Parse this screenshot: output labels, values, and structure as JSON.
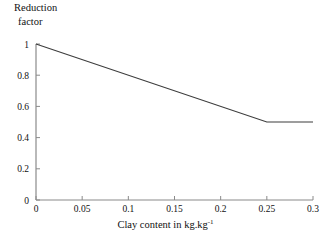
{
  "chart_data": {
    "type": "line",
    "title": "",
    "xlabel": "Clay content in kg.kg",
    "xlabel_exponent": "-1",
    "ylabel_line1": "Reduction",
    "ylabel_line2": "factor",
    "xlim": [
      0,
      0.3
    ],
    "ylim": [
      0,
      1
    ],
    "grid": false,
    "legend": "none",
    "xticks": [
      "0",
      "0.05",
      "0.1",
      "0.15",
      "0.2",
      "0.25",
      "0.3"
    ],
    "xtick_values": [
      0,
      0.05,
      0.1,
      0.15,
      0.2,
      0.25,
      0.3
    ],
    "yticks": [
      "0",
      "0.2",
      "0.4",
      "0.6",
      "0.8",
      "1"
    ],
    "ytick_values": [
      0,
      0.2,
      0.4,
      0.6,
      0.8,
      1
    ],
    "series": [
      {
        "name": "Reduction factor",
        "color": "#3d3d3d",
        "x": [
          0,
          0.25,
          0.3
        ],
        "values": [
          1,
          0.5,
          0.5
        ]
      }
    ],
    "annotations": []
  },
  "axes": {
    "line_color": "#8a8a8a",
    "tick_color": "#8a8a8a",
    "background": "#ffffff"
  }
}
